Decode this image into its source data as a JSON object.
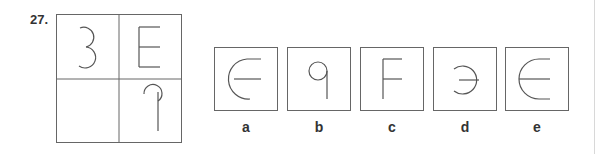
{
  "question": {
    "number": "27.",
    "matrix": {
      "cells": [
        {
          "position": "top-left",
          "glyph": "3"
        },
        {
          "position": "top-right",
          "glyph": "E"
        },
        {
          "position": "bottom-left",
          "glyph": ""
        },
        {
          "position": "bottom-right",
          "glyph": "mirrored-9"
        }
      ]
    },
    "options": [
      {
        "label": "a",
        "glyph": "open-circle-with-bar (€-like)"
      },
      {
        "label": "b",
        "glyph": "9"
      },
      {
        "label": "c",
        "glyph": "F"
      },
      {
        "label": "d",
        "glyph": "Э-like"
      },
      {
        "label": "e",
        "glyph": "rounded-E"
      }
    ]
  },
  "colors": {
    "stroke": "#555555",
    "box": "#666666",
    "text": "#333333"
  }
}
